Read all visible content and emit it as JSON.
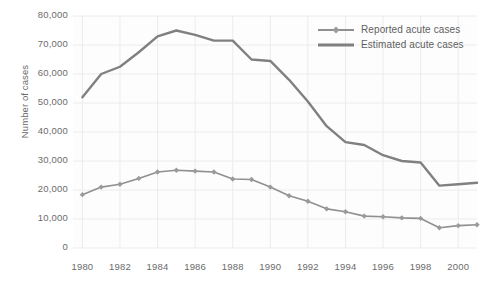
{
  "chart_data": {
    "type": "line",
    "title": "",
    "xlabel": "",
    "ylabel": "Number of cases",
    "xlim": [
      1979.5,
      2001.0
    ],
    "ylim": [
      0,
      80000
    ],
    "grid": true,
    "legend_position": "top-right",
    "ytick_labels": [
      "80,000",
      "70,000",
      "60,000",
      "50,000",
      "40,000",
      "30,000",
      "20,000",
      "10,000",
      "0"
    ],
    "ytick_values": [
      80000,
      70000,
      60000,
      50000,
      40000,
      30000,
      20000,
      10000,
      0
    ],
    "xtick_labels": [
      "1980",
      "1982",
      "1984",
      "1986",
      "1988",
      "1990",
      "1992",
      "1994",
      "1996",
      "1998",
      "2000"
    ],
    "xtick_values": [
      1980,
      1982,
      1984,
      1986,
      1988,
      1990,
      1992,
      1994,
      1996,
      1998,
      2000
    ],
    "x": [
      1980,
      1981,
      1982,
      1983,
      1984,
      1985,
      1986,
      1987,
      1988,
      1989,
      1990,
      1991,
      1992,
      1993,
      1994,
      1995,
      1996,
      1997,
      1998,
      1999,
      2000,
      2001
    ],
    "series": [
      {
        "name": "Reported acute cases",
        "color": "#909090",
        "marker": "diamond",
        "line_width": 1.6,
        "values": [
          18400,
          21000,
          22000,
          24000,
          26200,
          26800,
          26500,
          26200,
          23800,
          23600,
          21000,
          18000,
          16100,
          13500,
          12500,
          11000,
          10800,
          10400,
          10200,
          7000,
          7700,
          8000
        ]
      },
      {
        "name": "Estimated acute cases",
        "color": "#808080",
        "marker": "none",
        "line_width": 2.4,
        "values": [
          52000,
          60000,
          62500,
          67500,
          73000,
          75000,
          73500,
          71500,
          71500,
          65000,
          64500,
          58000,
          50500,
          42000,
          36500,
          35500,
          32000,
          30000,
          29500,
          21500,
          22000,
          22500
        ]
      }
    ]
  }
}
